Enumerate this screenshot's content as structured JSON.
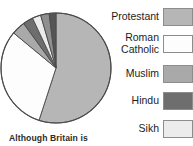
{
  "chart_data": {
    "type": "pie",
    "title": "",
    "legend_position": "right",
    "categories": [
      "Protestant",
      "Roman Catholic",
      "Muslim",
      "Hindu",
      "Sikh",
      "Other",
      "Jewish"
    ],
    "values": [
      55,
      31,
      4,
      3,
      2.5,
      2.5,
      2
    ],
    "colors": [
      "#b6b6b6",
      "#fdfdfd",
      "#a9a9a9",
      "#6e6e6e",
      "#ececec",
      "#8f8f8f",
      "#555555"
    ],
    "slices": [
      {
        "label": "Protestant",
        "value": 55,
        "color": "#b6b6b6",
        "start_angle": 0,
        "end_angle": 198
      },
      {
        "label": "Roman Catholic",
        "value": 31,
        "color": "#fdfdfd",
        "start_angle": 198,
        "end_angle": 309.6
      },
      {
        "label": "Muslim",
        "value": 4,
        "color": "#a9a9a9",
        "start_angle": 309.6,
        "end_angle": 324
      },
      {
        "label": "Hindu",
        "value": 3,
        "color": "#6e6e6e",
        "start_angle": 324,
        "end_angle": 334.8
      },
      {
        "label": "Sikh",
        "value": 2.5,
        "color": "#ececec",
        "start_angle": 334.8,
        "end_angle": 343.8
      },
      {
        "label": "Other",
        "value": 2.5,
        "color": "#8f8f8f",
        "start_angle": 343.8,
        "end_angle": 352.8
      },
      {
        "label": "Jewish",
        "value": 2,
        "color": "#555555",
        "start_angle": 352.8,
        "end_angle": 360
      }
    ],
    "xlabel": "",
    "ylabel": ""
  },
  "caption": {
    "text": "Although Britain is"
  },
  "legend": {
    "items": [
      {
        "label": "Protestant",
        "color": "#b6b6b6",
        "swatch_name": "swatch-protestant"
      },
      {
        "label": "Roman\nCatholic",
        "color": "#fdfdfd",
        "swatch_name": "swatch-roman-catholic"
      },
      {
        "label": "Muslim",
        "color": "#a9a9a9",
        "swatch_name": "swatch-muslim"
      },
      {
        "label": "Hindu",
        "color": "#6e6e6e",
        "swatch_name": "swatch-hindu"
      },
      {
        "label": "Sikh",
        "color": "#ececec",
        "swatch_name": "swatch-sikh"
      }
    ]
  },
  "colors": {
    "page_background": "#ffffff",
    "pie_outline": "#4a4a4a",
    "swatch_border": "#8d8d8d",
    "text": "#1c1c1c",
    "caption_text": "#2b2b2b"
  }
}
